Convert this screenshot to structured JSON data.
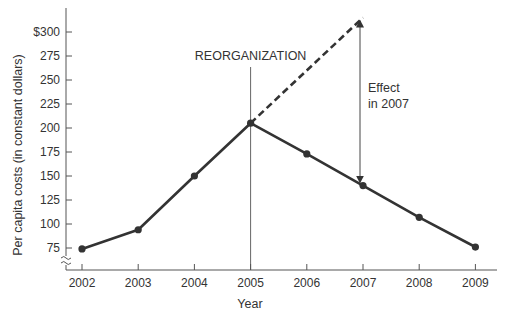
{
  "chart_data": {
    "type": "line",
    "title": "",
    "xlabel": "Year",
    "ylabel": "Per capita costs (in constant dollars)",
    "categories": [
      "2002",
      "2003",
      "2004",
      "2005",
      "2006",
      "2007",
      "2008",
      "2009"
    ],
    "series": [
      {
        "name": "Actual per capita costs",
        "style": "solid",
        "values": [
          74,
          94,
          150,
          205,
          173,
          140,
          107,
          76
        ]
      },
      {
        "name": "Projected trend (pre-reorganization)",
        "style": "dashed",
        "x": [
          "2005",
          "2007"
        ],
        "values": [
          205,
          315
        ]
      }
    ],
    "yticks": [
      75,
      100,
      125,
      150,
      175,
      200,
      225,
      250,
      275,
      300
    ],
    "ytick_labels": [
      "75",
      "100",
      "125",
      "150",
      "175",
      "200",
      "225",
      "250",
      "275",
      "$300"
    ],
    "ylim": [
      60,
      320
    ],
    "grid": false,
    "axis_break": true,
    "annotations": [
      {
        "text": "REORGANIZATION",
        "x": "2005",
        "type": "vertical-line"
      },
      {
        "text_line1": "Effect",
        "text_line2": "in 2007",
        "x": "2007",
        "type": "double-arrow",
        "from": 140,
        "to": 315
      }
    ],
    "colors": {
      "line": "#333333",
      "axis": "#555555",
      "text": "#333333"
    }
  }
}
